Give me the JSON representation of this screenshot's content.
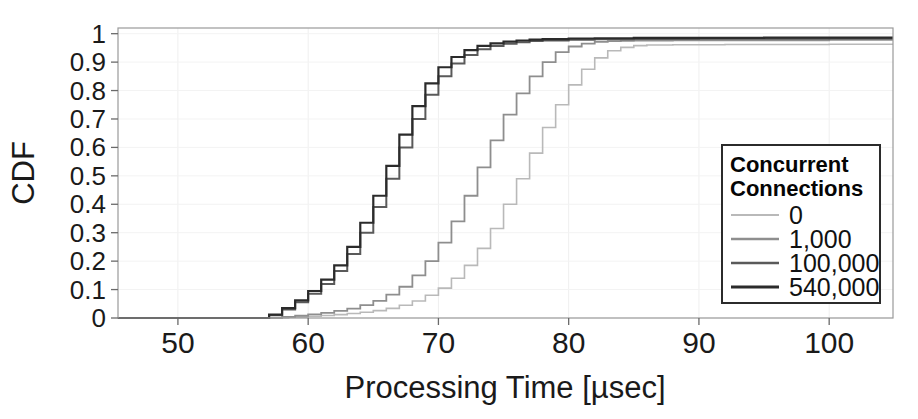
{
  "chart_data": {
    "type": "line",
    "title": "",
    "xlabel": "Processing Time [µsec]",
    "ylabel": "CDF",
    "xlim": [
      45.4,
      104.9
    ],
    "ylim": [
      0,
      1.02
    ],
    "grid": true,
    "step_plot": true,
    "xticks": [
      50,
      60,
      70,
      80,
      90,
      100
    ],
    "xtick_labels": [
      "50",
      "60",
      "70",
      "80",
      "90",
      "100"
    ],
    "yticks": [
      0,
      0.1,
      0.2,
      0.3,
      0.4,
      0.5,
      0.6,
      0.7,
      0.8,
      0.9,
      1
    ],
    "ytick_labels": [
      "0",
      "0.1",
      "0.2",
      "0.3",
      "0.4",
      "0.5",
      "0.6",
      "0.7",
      "0.8",
      "0.9",
      "1"
    ],
    "legend": {
      "title": "Concurrent\nConnections",
      "title_line1": "Concurrent",
      "title_line2": "Connections",
      "position": "lower right"
    },
    "series": [
      {
        "name": "0",
        "color": "#b9b9b9",
        "width": 1.6,
        "x": [
          45.4,
          57.0,
          58.5,
          60.0,
          61.0,
          62.0,
          63.0,
          64.0,
          65.0,
          66.0,
          67.0,
          68.0,
          69.0,
          70.0,
          71.0,
          72.0,
          73.0,
          74.0,
          75.0,
          76.0,
          77.0,
          78.0,
          79.0,
          80.0,
          81.0,
          82.0,
          83.0,
          84.0,
          85.0,
          86.0,
          88.0,
          92.0,
          96.0,
          100.0,
          104.9
        ],
        "y": [
          0.0,
          0.0,
          0.003,
          0.006,
          0.009,
          0.012,
          0.016,
          0.02,
          0.026,
          0.034,
          0.045,
          0.06,
          0.08,
          0.105,
          0.14,
          0.185,
          0.245,
          0.315,
          0.4,
          0.49,
          0.58,
          0.67,
          0.75,
          0.82,
          0.875,
          0.915,
          0.94,
          0.952,
          0.958,
          0.96,
          0.961,
          0.962,
          0.962,
          0.963,
          0.963
        ]
      },
      {
        "name": "1,000",
        "color": "#8e8e8e",
        "width": 1.8,
        "x": [
          45.4,
          56.5,
          58.0,
          59.0,
          60.0,
          61.0,
          62.0,
          63.0,
          64.0,
          65.0,
          66.0,
          67.0,
          68.0,
          69.0,
          70.0,
          71.0,
          72.0,
          73.0,
          74.0,
          75.0,
          76.0,
          77.0,
          78.0,
          79.0,
          80.0,
          81.0,
          82.0,
          83.0,
          84.0,
          85.0,
          86.0,
          88.0,
          92.0,
          96.0,
          100.0,
          104.9
        ],
        "y": [
          0.0,
          0.0,
          0.004,
          0.008,
          0.013,
          0.018,
          0.025,
          0.033,
          0.045,
          0.06,
          0.082,
          0.11,
          0.15,
          0.2,
          0.265,
          0.34,
          0.43,
          0.53,
          0.625,
          0.715,
          0.79,
          0.85,
          0.9,
          0.935,
          0.955,
          0.965,
          0.971,
          0.974,
          0.975,
          0.976,
          0.976,
          0.977,
          0.977,
          0.977,
          0.978,
          0.978
        ]
      },
      {
        "name": "100,000",
        "color": "#5a5a5a",
        "width": 2.0,
        "x": [
          45.4,
          56.0,
          57.0,
          58.0,
          59.0,
          60.0,
          61.0,
          62.0,
          63.0,
          64.0,
          65.0,
          66.0,
          67.0,
          68.0,
          69.0,
          70.0,
          71.0,
          72.0,
          73.0,
          74.0,
          75.0,
          76.0,
          77.0,
          78.0,
          80.0,
          82.0,
          85.0,
          90.0,
          95.0,
          100.0,
          104.9
        ],
        "y": [
          0.0,
          0.0,
          0.01,
          0.03,
          0.055,
          0.085,
          0.12,
          0.165,
          0.225,
          0.3,
          0.39,
          0.49,
          0.6,
          0.7,
          0.785,
          0.85,
          0.895,
          0.925,
          0.945,
          0.957,
          0.965,
          0.97,
          0.974,
          0.976,
          0.979,
          0.98,
          0.981,
          0.982,
          0.982,
          0.983,
          0.983
        ]
      },
      {
        "name": "540,000",
        "color": "#2b2b2b",
        "width": 2.2,
        "x": [
          45.4,
          56.0,
          57.0,
          58.0,
          59.0,
          60.0,
          61.0,
          62.0,
          63.0,
          64.0,
          65.0,
          66.0,
          67.0,
          68.0,
          69.0,
          70.0,
          71.0,
          72.0,
          73.0,
          74.0,
          75.0,
          76.0,
          77.0,
          78.0,
          80.0,
          82.0,
          85.0,
          90.0,
          95.0,
          100.0,
          104.9
        ],
        "y": [
          0.0,
          0.0,
          0.012,
          0.035,
          0.062,
          0.095,
          0.135,
          0.185,
          0.25,
          0.335,
          0.43,
          0.535,
          0.645,
          0.745,
          0.825,
          0.882,
          0.918,
          0.942,
          0.957,
          0.966,
          0.972,
          0.976,
          0.979,
          0.981,
          0.983,
          0.984,
          0.985,
          0.985,
          0.986,
          0.986,
          0.986
        ]
      }
    ]
  },
  "axes": {
    "x_title": "Processing Time [µsec]",
    "y_title": "CDF"
  },
  "legend_entries": [
    {
      "label": "0",
      "color": "#b9b9b9",
      "width": 1.6
    },
    {
      "label": "1,000",
      "color": "#8e8e8e",
      "width": 1.8
    },
    {
      "label": "100,000",
      "color": "#5a5a5a",
      "width": 2.0
    },
    {
      "label": "540,000",
      "color": "#2b2b2b",
      "width": 2.2
    }
  ],
  "legend_box": {
    "title_line1": "Concurrent",
    "title_line2": "Connections"
  }
}
